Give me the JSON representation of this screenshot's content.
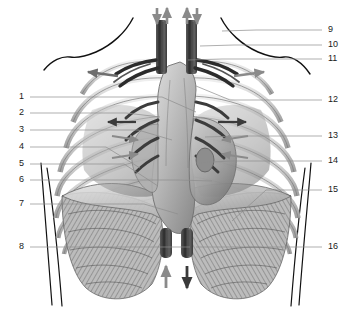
{
  "figure": {
    "style": "grayscale medical illustration",
    "background_color": "#ffffff",
    "line_color": "#1a1a1a",
    "leader_color": "#8c8c8c",
    "arrow_gray": "#8a8a8a",
    "arrow_dark": "#3a3a3a",
    "tissue_light": "#d8d8d8",
    "tissue_mid": "#a8a8a8",
    "tissue_dark": "#6e6e6e"
  },
  "labels": {
    "left": [
      {
        "id": "1",
        "text": "1",
        "y": 97,
        "line_to_x": 196,
        "line_to_y": 112
      },
      {
        "id": "2",
        "text": "2",
        "y": 113,
        "line_to_x": 160,
        "line_to_y": 117
      },
      {
        "id": "3",
        "text": "3",
        "y": 130,
        "line_to_x": 172,
        "line_to_y": 140
      },
      {
        "id": "4",
        "text": "4",
        "y": 147,
        "line_to_x": 140,
        "line_to_y": 168
      },
      {
        "id": "5",
        "text": "5",
        "y": 164,
        "line_to_x": 158,
        "line_to_y": 186
      },
      {
        "id": "6",
        "text": "6",
        "y": 180,
        "line_to_x": 212,
        "line_to_y": 181
      },
      {
        "id": "7",
        "text": "7",
        "y": 204,
        "line_to_x": 178,
        "line_to_y": 214
      },
      {
        "id": "8",
        "text": "8",
        "y": 247,
        "line_to_x": 190,
        "line_to_y": 247
      }
    ],
    "right": [
      {
        "id": "9",
        "text": "9",
        "y": 30,
        "line_to_x": 222,
        "line_to_y": 31
      },
      {
        "id": "10",
        "text": "10",
        "y": 45,
        "line_to_x": 200,
        "line_to_y": 46
      },
      {
        "id": "11",
        "text": "11",
        "y": 59,
        "line_to_x": 188,
        "line_to_y": 60
      },
      {
        "id": "12",
        "text": "12",
        "y": 100,
        "line_to_x": 196,
        "line_to_y": 86
      },
      {
        "id": "13",
        "text": "13",
        "y": 136,
        "line_to_x": 205,
        "line_to_y": 137
      },
      {
        "id": "14",
        "text": "14",
        "y": 161,
        "line_to_x": 196,
        "line_to_y": 163
      },
      {
        "id": "15",
        "text": "15",
        "y": 190,
        "line_to_x": 232,
        "line_to_y": 221
      },
      {
        "id": "16",
        "text": "16",
        "y": 247,
        "line_to_x": 196,
        "line_to_y": 247
      }
    ]
  },
  "arrows": {
    "airflow_top": [
      {
        "name": "top-left-down-arrow",
        "direction": "down",
        "color": "#8a8a8a"
      },
      {
        "name": "top-left-up-arrow",
        "direction": "up",
        "color": "#8a8a8a"
      },
      {
        "name": "top-right-up-arrow",
        "direction": "up",
        "color": "#8a8a8a"
      },
      {
        "name": "top-right-down-arrow",
        "direction": "down",
        "color": "#8a8a8a"
      }
    ],
    "airflow_bottom": [
      {
        "name": "bottom-up-arrow",
        "direction": "up",
        "color": "#8a8a8a"
      },
      {
        "name": "bottom-down-arrow",
        "direction": "down",
        "color": "#3a3a3a"
      }
    ],
    "expansion": [
      {
        "name": "upper-left-outward-arrow",
        "direction": "left",
        "color": "#6e6e6e"
      },
      {
        "name": "upper-right-outward-arrow",
        "direction": "right",
        "color": "#8a8a8a"
      },
      {
        "name": "mid-left-outward-arrow",
        "direction": "left",
        "color": "#3a3a3a"
      },
      {
        "name": "mid-right-outward-arrow",
        "direction": "right",
        "color": "#3a3a3a"
      },
      {
        "name": "left-inward-arrow-upper",
        "direction": "right",
        "color": "#8a8a8a"
      },
      {
        "name": "left-inward-arrow-lower",
        "direction": "right",
        "color": "#8a8a8a"
      },
      {
        "name": "right-inward-arrow-upper",
        "direction": "left",
        "color": "#8a8a8a"
      },
      {
        "name": "right-inward-arrow-lower",
        "direction": "left",
        "color": "#8a8a8a"
      }
    ]
  }
}
